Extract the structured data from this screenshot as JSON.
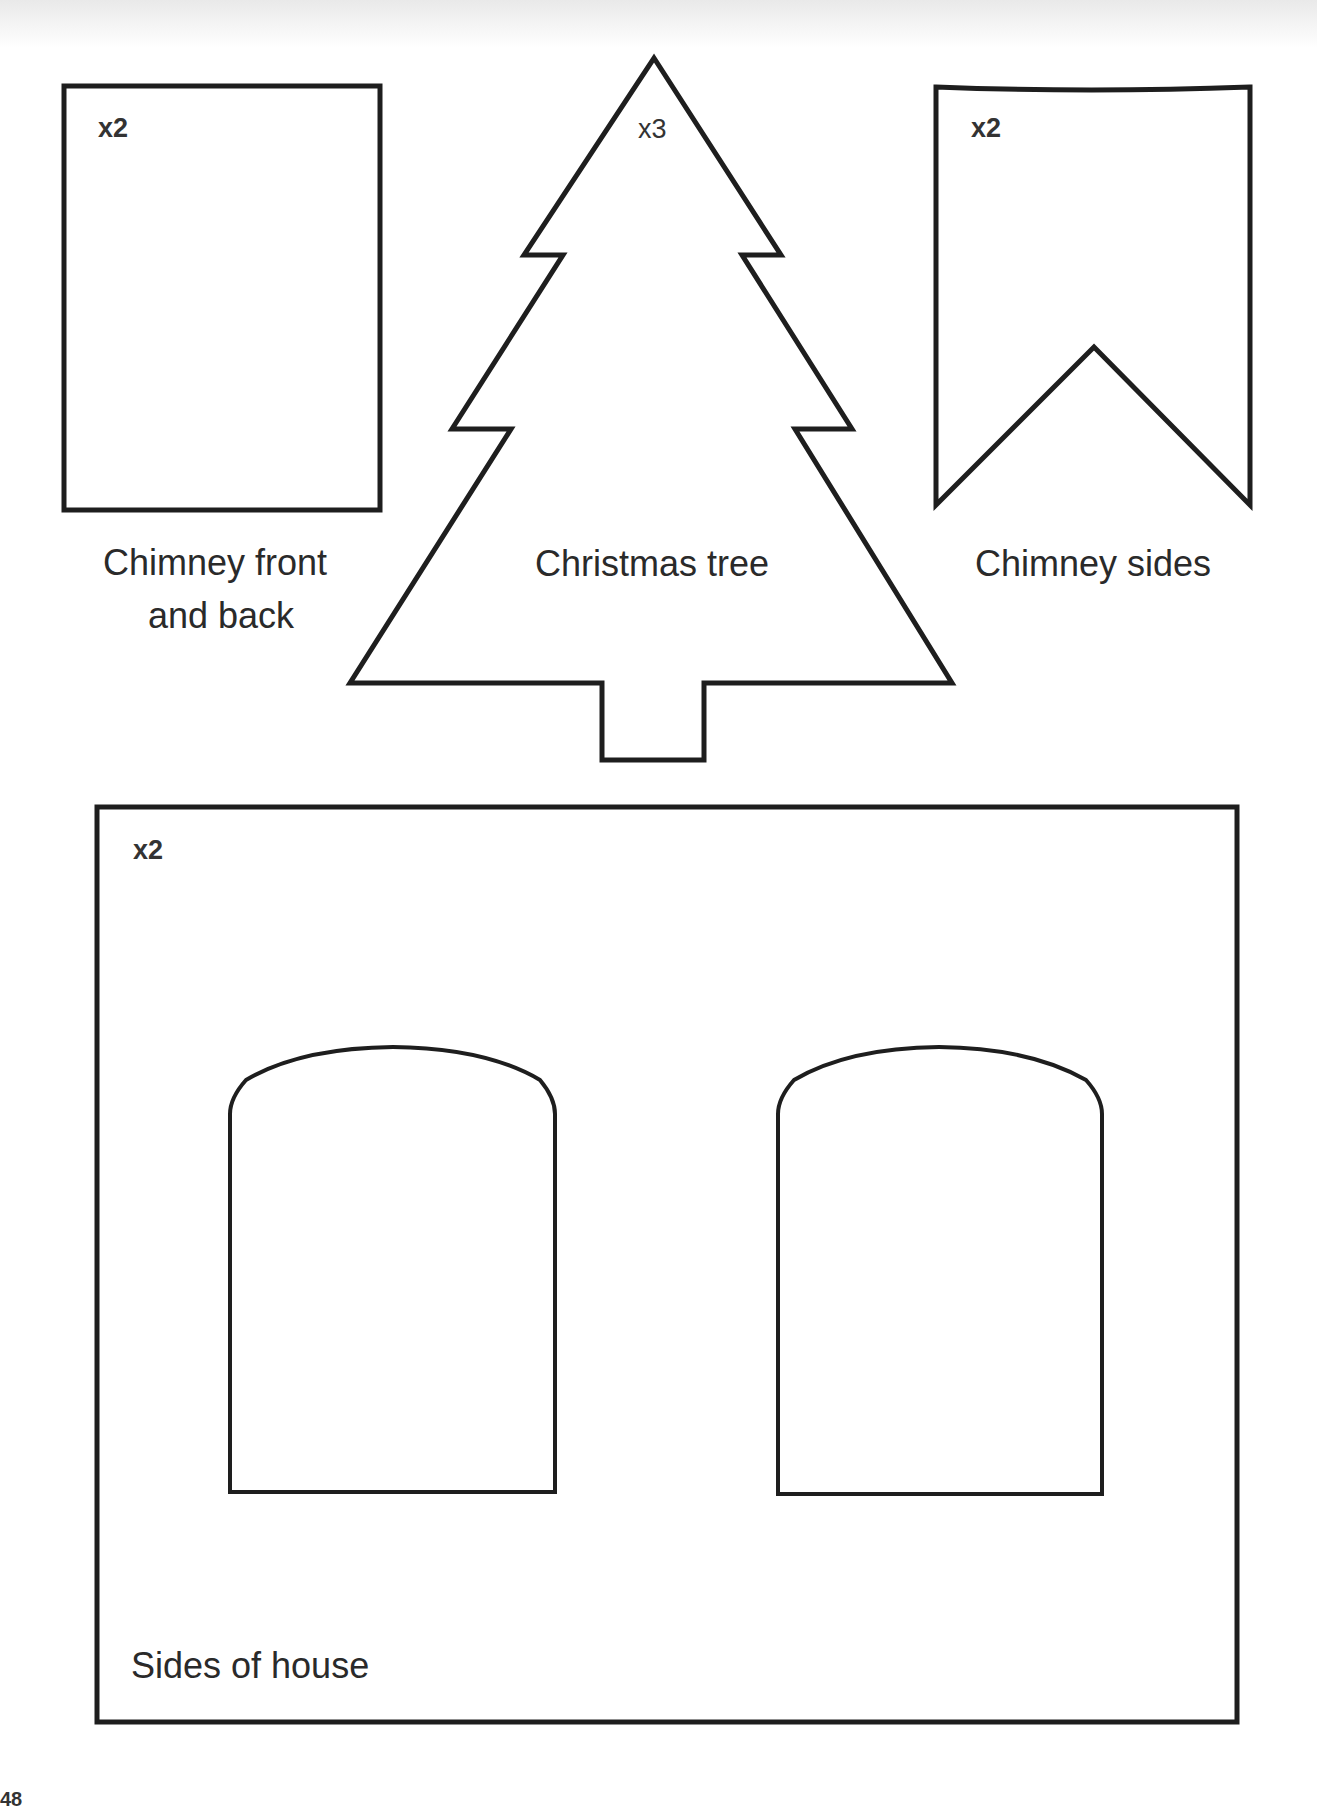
{
  "pieces": {
    "chimney_front_back": {
      "quantity": "x2",
      "label_line1": "Chimney front",
      "label_line2": "and back"
    },
    "christmas_tree": {
      "quantity": "x3",
      "label": "Christmas tree"
    },
    "chimney_sides": {
      "quantity": "x2",
      "label": "Chimney sides"
    },
    "sides_of_house": {
      "quantity": "x2",
      "label": "Sides of house"
    }
  },
  "page_number": "48",
  "colors": {
    "outline": "#1e1e1e",
    "text": "#2a2a2a",
    "background": "#ffffff"
  }
}
